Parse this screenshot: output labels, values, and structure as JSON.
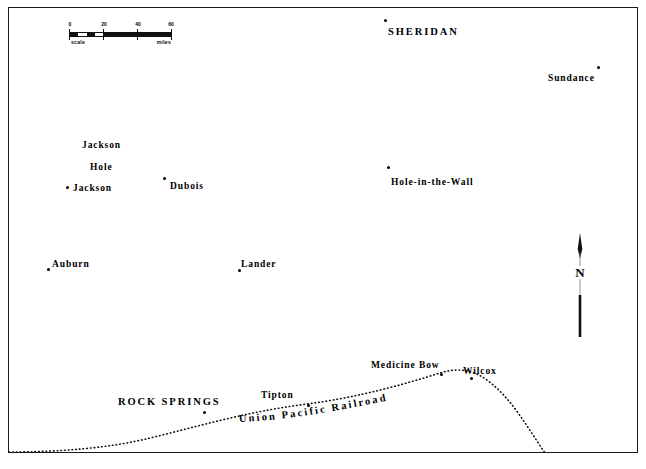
{
  "map": {
    "title_note": "",
    "background_color": "#ffffff",
    "ink_color": "#000000",
    "frame": {
      "x": 8,
      "y": 7,
      "width": 630,
      "height": 446
    }
  },
  "scale": {
    "label_left": "scale",
    "label_right": "miles",
    "ticks": [
      "0",
      "20",
      "40",
      "60"
    ],
    "units": "miles"
  },
  "compass": {
    "north_label": "N"
  },
  "railroad": {
    "name": "Union Pacific Railroad",
    "style": "dotted"
  },
  "places": [
    {
      "name": "SHERIDAN",
      "type": "city",
      "label_x": 388,
      "label_y": 26,
      "dot_x": 384,
      "dot_y": 19
    },
    {
      "name": "Sundance",
      "type": "town",
      "label_x": 548,
      "label_y": 73,
      "dot_x": 597,
      "dot_y": 66
    },
    {
      "name": "Jackson",
      "type": "town",
      "label_x": 82,
      "label_y": 140,
      "dot_x": null,
      "dot_y": null
    },
    {
      "name": "Hole",
      "type": "town",
      "label_x": 90,
      "label_y": 162,
      "dot_x": null,
      "dot_y": null
    },
    {
      "name": "Jackson",
      "type": "town",
      "label_x": 73,
      "label_y": 183,
      "dot_x": 66,
      "dot_y": 186
    },
    {
      "name": "Dubois",
      "type": "town",
      "label_x": 170,
      "label_y": 181,
      "dot_x": 163,
      "dot_y": 177
    },
    {
      "name": "Hole-in-the-Wall",
      "type": "town",
      "label_x": 391,
      "label_y": 177,
      "dot_x": 387,
      "dot_y": 166
    },
    {
      "name": "Auburn",
      "type": "town",
      "label_x": 52,
      "label_y": 259,
      "dot_x": 47,
      "dot_y": 268
    },
    {
      "name": "Lander",
      "type": "town",
      "label_x": 241,
      "label_y": 259,
      "dot_x": 238,
      "dot_y": 269
    },
    {
      "name": "Medicine Bow",
      "type": "town",
      "label_x": 371,
      "label_y": 360,
      "dot_x": 440,
      "dot_y": 373
    },
    {
      "name": "Wilcox",
      "type": "town",
      "label_x": 463,
      "label_y": 366,
      "dot_x": 470,
      "dot_y": 377
    },
    {
      "name": "ROCK SPRINGS",
      "type": "city",
      "label_x": 118,
      "label_y": 396,
      "dot_x": 203,
      "dot_y": 411
    },
    {
      "name": "Tipton",
      "type": "town",
      "label_x": 261,
      "label_y": 390,
      "dot_x": 307,
      "dot_y": 404
    }
  ],
  "footer": {
    "note": ""
  }
}
